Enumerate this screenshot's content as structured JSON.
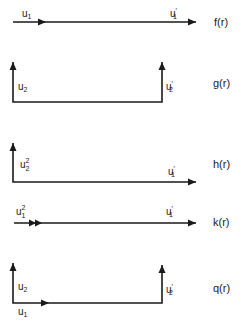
{
  "diagrams": [
    {
      "id": "f",
      "function_label": "f(r)",
      "labels": {
        "left": "u",
        "left_sub": "1",
        "right": "u",
        "right_sub": "1",
        "right_prime": "′"
      }
    },
    {
      "id": "g",
      "function_label": "g(r)",
      "labels": {
        "left": "u",
        "left_sub": "2",
        "right": "u",
        "right_sub": "2",
        "right_prime": "′"
      }
    },
    {
      "id": "h",
      "function_label": "h(r)",
      "labels": {
        "left": "u",
        "left_sup": "2",
        "left_sub": "2",
        "right": "u",
        "right_sub": "1",
        "right_prime": "′"
      }
    },
    {
      "id": "k",
      "function_label": "k(r)",
      "labels": {
        "left": "u",
        "left_sup": "2",
        "left_sub": "1",
        "right": "u",
        "right_sub": "1",
        "right_prime": "′"
      }
    },
    {
      "id": "q",
      "function_label": "q(r)",
      "labels": {
        "vert": "u",
        "vert_sub": "2",
        "horiz": "u",
        "horiz_sub": "1",
        "right": "u",
        "right_sub": "2",
        "right_prime": "′"
      }
    }
  ]
}
